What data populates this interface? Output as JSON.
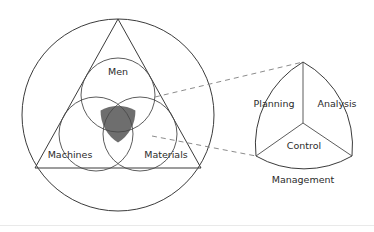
{
  "figure": {
    "background_color": "#ffffff",
    "line_color": "#3b3b3b",
    "dashed_color": "#8c8c8c",
    "overlap_fill_color": "#6e6e6e",
    "label_color": "#2b2b2b"
  },
  "left_diagram": {
    "name": "production-resources-venn",
    "outer_circle": {
      "cx": 118,
      "cy": 115,
      "r": 96
    },
    "triangle": {
      "apex": {
        "x": 118,
        "y": 19
      },
      "bottom_left": {
        "x": 35,
        "y": 168
      },
      "bottom_right": {
        "x": 201,
        "y": 168
      }
    },
    "circles": [
      {
        "label": "Men",
        "cx": 118,
        "cy": 95,
        "r": 37,
        "label_x": 118,
        "label_y": 72
      },
      {
        "label": "Machines",
        "cx": 96,
        "cy": 134,
        "r": 37,
        "label_x": 70,
        "label_y": 155
      },
      {
        "label": "Materials",
        "cx": 140,
        "cy": 134,
        "r": 37,
        "label_x": 166,
        "label_y": 155
      }
    ],
    "overlap_region": {
      "name": "core-intersection",
      "fill": "#6e6e6e"
    }
  },
  "connectors": [
    {
      "name": "upper-dashed-connector",
      "x1": 155,
      "y1": 97,
      "x2": 303,
      "y2": 62
    },
    {
      "name": "lower-dashed-connector",
      "x1": 152,
      "y1": 136,
      "x2": 256,
      "y2": 156
    }
  ],
  "right_diagram": {
    "name": "management-reuleaux",
    "vertices": {
      "top": {
        "x": 303,
        "y": 62
      },
      "bottom_left": {
        "x": 256,
        "y": 156
      },
      "bottom_right": {
        "x": 352,
        "y": 156
      }
    },
    "center": {
      "x": 303,
      "y": 123
    },
    "sectors": [
      {
        "label": "Planning",
        "label_x": 274,
        "label_y": 104
      },
      {
        "label": "Analysis",
        "label_x": 337,
        "label_y": 104
      },
      {
        "label": "Control",
        "label_x": 304,
        "label_y": 146
      }
    ],
    "caption": {
      "label": "Management",
      "label_x": 303,
      "label_y": 180
    }
  }
}
